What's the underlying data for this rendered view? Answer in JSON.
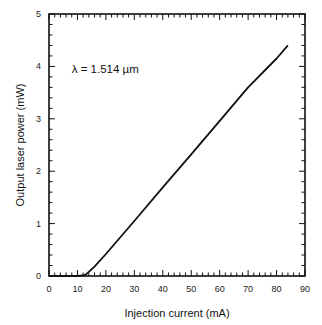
{
  "chart_data": {
    "type": "line",
    "title": "",
    "xlabel": "Injection current (mA)",
    "ylabel": "Output laser power (mW)",
    "xlim": [
      0,
      90
    ],
    "ylim": [
      0,
      5
    ],
    "x_ticks": [
      0,
      10,
      20,
      30,
      40,
      50,
      60,
      70,
      80,
      90
    ],
    "y_ticks": [
      0,
      1,
      2,
      3,
      4,
      5
    ],
    "grid": false,
    "legend": null,
    "annotations": [
      {
        "text": "λ = 1.514 µm",
        "x": 8,
        "y": 3.95
      }
    ],
    "series": [
      {
        "name": "L-I curve",
        "x": [
          0,
          5,
          10,
          12,
          13,
          14,
          16,
          20,
          30,
          40,
          50,
          60,
          70,
          80,
          84
        ],
        "y": [
          0,
          0,
          0,
          0.01,
          0.03,
          0.08,
          0.18,
          0.42,
          1.05,
          1.69,
          2.32,
          2.96,
          3.6,
          4.15,
          4.4
        ]
      }
    ]
  },
  "labels": {
    "xlabel": "Injection current (mA)",
    "ylabel": "Output laser power (mW)",
    "annotation": "λ = 1.514 µm"
  }
}
